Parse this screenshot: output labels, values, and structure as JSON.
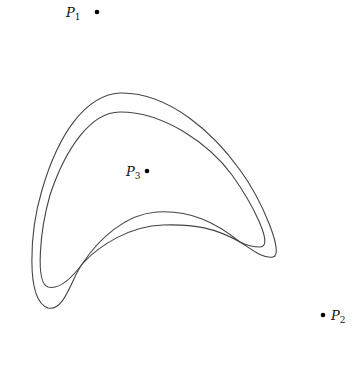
{
  "diagram": {
    "points": [
      {
        "name": "P",
        "sub": "1",
        "x": 97,
        "y": 12,
        "label_side": "left"
      },
      {
        "name": "P",
        "sub": "2",
        "x": 323,
        "y": 315,
        "label_side": "right"
      },
      {
        "name": "P",
        "sub": "3",
        "x": 147,
        "y": 171,
        "label_side": "left"
      }
    ],
    "curves": [
      {
        "id": "outer",
        "description": "outer boomerang-shaped closed curve"
      },
      {
        "id": "inner",
        "description": "inner boomerang-shaped closed curve, crossing the outer along the lower arc"
      }
    ],
    "colors": {
      "stroke": "#444444",
      "point": "#000000",
      "background": "#ffffff"
    }
  }
}
